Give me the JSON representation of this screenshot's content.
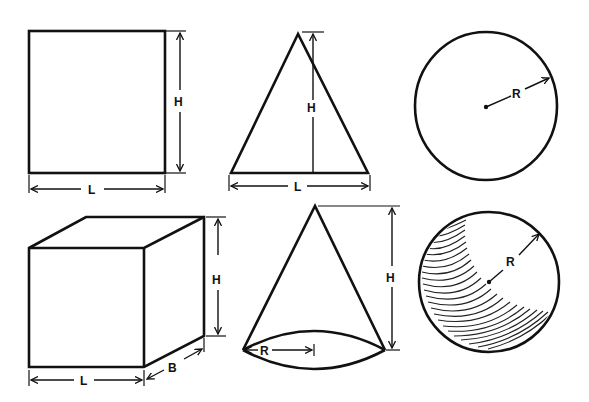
{
  "diagram": {
    "colors": {
      "ink": "#111111",
      "background": "#ffffff"
    },
    "top_row": [
      {
        "id": "square",
        "shape": "square",
        "labels": {
          "height": "H",
          "length": "L"
        }
      },
      {
        "id": "triangle",
        "shape": "triangle",
        "labels": {
          "height": "H",
          "length": "L"
        }
      },
      {
        "id": "circle",
        "shape": "circle",
        "labels": {
          "radius": "R"
        }
      }
    ],
    "bottom_row": [
      {
        "id": "cube",
        "shape": "cube",
        "labels": {
          "height": "H",
          "length": "L",
          "breadth": "B"
        }
      },
      {
        "id": "cone",
        "shape": "cone",
        "labels": {
          "height": "H",
          "radius": "R"
        }
      },
      {
        "id": "sphere",
        "shape": "sphere",
        "labels": {
          "radius": "R"
        }
      }
    ]
  },
  "labels": {
    "square_h": "H",
    "square_l": "L",
    "triangle_h": "H",
    "triangle_l": "L",
    "circle_r": "R",
    "cube_h": "H",
    "cube_l": "L",
    "cube_b": "B",
    "cone_h": "H",
    "cone_r": "R",
    "sphere_r": "R"
  }
}
